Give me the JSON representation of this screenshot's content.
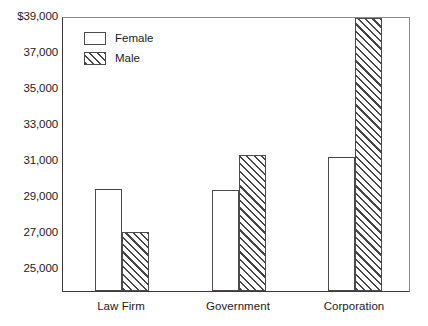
{
  "chart_data": {
    "type": "bar",
    "title": "",
    "subtitle": "",
    "xlabel": "",
    "ylabel": "",
    "categories": [
      "Law Firm",
      "Government",
      "Corporation"
    ],
    "series": [
      {
        "name": "Female",
        "values": [
          29350,
          29300,
          31150
        ],
        "fill": "white",
        "border": "#4a4a4a"
      },
      {
        "name": "Male",
        "values": [
          27000,
          31250,
          38900
        ],
        "fill": "diagonal-hatch",
        "border": "#4a4a4a"
      }
    ],
    "ylim": [
      23700,
      39000
    ],
    "yticks": [
      39000,
      37000,
      35000,
      33000,
      31000,
      29000,
      27000,
      25000
    ],
    "ytick_labels": [
      "$39,000",
      "37,000",
      "35,000",
      "33,000",
      "31,000",
      "29,000",
      "27,000",
      "25,000"
    ],
    "grid": false,
    "legend_position": "top-left-inside",
    "legend_entries": [
      "Female",
      "Male"
    ],
    "axis_color": "#3a3a3a",
    "background": "#ffffff"
  }
}
